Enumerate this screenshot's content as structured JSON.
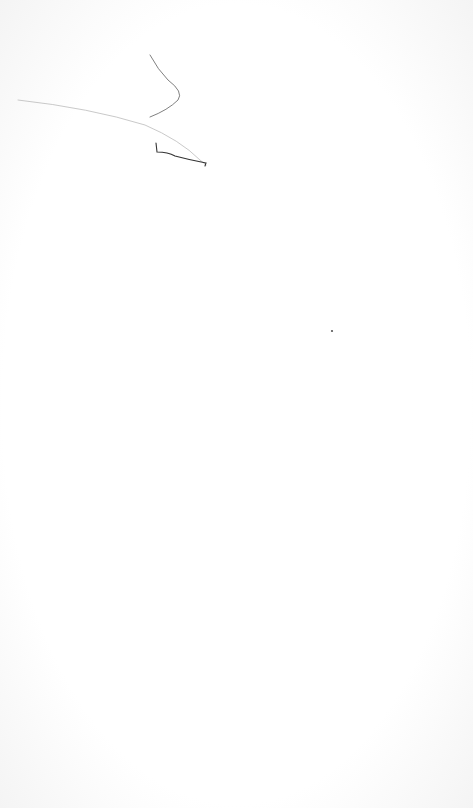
{
  "page": {
    "background_color": "#ffffff",
    "ink_color": "#2a2a2a",
    "faint_ink_color": "#c8c8c8"
  },
  "marks": [
    {
      "name": "curved-stroke",
      "kind": "pen-stroke"
    },
    {
      "name": "long-diagonal-stroke",
      "kind": "pen-stroke"
    },
    {
      "name": "hook-stroke",
      "kind": "pen-stroke"
    },
    {
      "name": "ink-dot",
      "kind": "dot"
    }
  ]
}
